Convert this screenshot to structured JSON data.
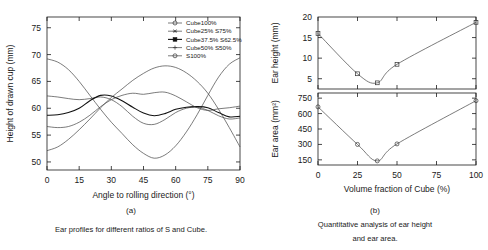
{
  "figure": {
    "panel_a": {
      "id": "(a)",
      "caption": "Ear profiles for different ratios of S and Cube.",
      "xlabel": "Angle to rolling direction (°)",
      "ylabel": "Height of drawn cup (mm)"
    },
    "panel_b": {
      "id": "(b)",
      "caption_line1": "Quantitative analysis of ear height",
      "caption_line2": "and ear area.",
      "xlabel": "Volume fraction of Cube (%)",
      "ylabel_top": "Ear height (mm)",
      "ylabel_bottom": "Ear area (mm²)"
    }
  },
  "chart_data": [
    {
      "type": "line",
      "id": "panel-a-ear-profiles",
      "title": "Ear profiles for different ratios of S and Cube.",
      "xlabel": "Angle to rolling direction (°)",
      "ylabel": "Height of drawn cup (mm)",
      "xlim": [
        0,
        90
      ],
      "ylim": [
        48.5,
        77
      ],
      "xticks": [
        0,
        15,
        30,
        45,
        60,
        75,
        90
      ],
      "yticks": [
        50,
        55,
        60,
        65,
        70,
        75
      ],
      "grid": false,
      "legend_position": "top-right",
      "x": [
        0,
        5,
        10,
        15,
        20,
        25,
        30,
        35,
        40,
        45,
        50,
        55,
        60,
        65,
        70,
        75,
        80,
        85,
        90
      ],
      "series": [
        {
          "name": "Cube100%",
          "marker": "open-circle",
          "values": [
            69.2,
            68.6,
            67.2,
            65.0,
            62.4,
            59.8,
            57.4,
            55.3,
            53.2,
            51.6,
            50.7,
            51.3,
            53.0,
            55.6,
            58.8,
            62.4,
            65.8,
            68.2,
            69.4
          ]
        },
        {
          "name": "Cube25% S75%",
          "marker": "star",
          "values": [
            62.3,
            62.1,
            61.8,
            61.6,
            61.8,
            62.1,
            61.6,
            60.3,
            58.5,
            57.2,
            57.0,
            57.9,
            59.2,
            60.0,
            60.2,
            59.6,
            58.6,
            58.0,
            58.2
          ]
        },
        {
          "name": "Cube37.5% S62.5%",
          "marker": "filled-square",
          "values": [
            58.7,
            58.8,
            59.2,
            60.0,
            61.4,
            62.4,
            62.3,
            61.4,
            60.2,
            59.1,
            58.6,
            59.0,
            59.8,
            60.2,
            60.3,
            60.1,
            59.2,
            58.4,
            58.5
          ]
        },
        {
          "name": "Cube50% S50%",
          "marker": "plus",
          "values": [
            56.6,
            56.4,
            56.6,
            57.4,
            58.7,
            60.3,
            61.6,
            62.4,
            62.8,
            62.6,
            62.9,
            63.0,
            62.3,
            61.2,
            60.1,
            59.6,
            59.9,
            60.1,
            60.4
          ]
        },
        {
          "name": "S100%",
          "marker": "open-circle",
          "values": [
            52.1,
            52.8,
            54.2,
            56.0,
            58.0,
            60.1,
            62.0,
            63.6,
            65.2,
            66.5,
            67.5,
            67.9,
            67.6,
            66.6,
            65.0,
            62.8,
            59.8,
            56.4,
            52.8
          ]
        }
      ]
    },
    {
      "type": "line",
      "id": "panel-b-ear-height",
      "ylabel": "Ear height (mm)",
      "xlabel": "Volume fraction of Cube (%)",
      "xlim": [
        0,
        100
      ],
      "ylim": [
        2.5,
        20
      ],
      "xticks": [
        0,
        25,
        50,
        75,
        100
      ],
      "yticks": [
        5,
        10,
        15,
        20
      ],
      "grid": false,
      "marker": "open-square",
      "x": [
        0,
        25,
        37.5,
        50,
        100
      ],
      "values": [
        16.0,
        6.2,
        4.0,
        8.5,
        18.7
      ]
    },
    {
      "type": "line",
      "id": "panel-b-ear-area",
      "ylabel": "Ear area (mm²)",
      "xlabel": "Volume fraction of Cube (%)",
      "xlim": [
        0,
        100
      ],
      "ylim": [
        100,
        800
      ],
      "xticks": [
        0,
        25,
        50,
        75,
        100
      ],
      "yticks": [
        150,
        300,
        450,
        600,
        750
      ],
      "grid": false,
      "marker": "open-circle",
      "x": [
        0,
        25,
        37.5,
        50,
        100
      ],
      "values": [
        665,
        300,
        140,
        305,
        725
      ]
    }
  ]
}
